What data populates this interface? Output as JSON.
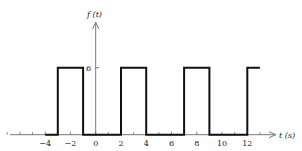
{
  "chart_data": {
    "type": "line",
    "title": "",
    "xlabel": "t (s)",
    "ylabel": "f(t)",
    "xlim": [
      -7.5,
      14.2
    ],
    "ylim": [
      0,
      6
    ],
    "x_ticks": [
      -4,
      -2,
      0,
      2,
      4,
      6,
      8,
      10,
      12
    ],
    "y_ticks": [
      6
    ],
    "grid": false,
    "legend": null,
    "series": [
      {
        "name": "f(t)",
        "style": "step (rectangular pulse train)",
        "x": [
          -4,
          -3,
          -3,
          -1,
          -1,
          2,
          2,
          4,
          4,
          7,
          7,
          9,
          9,
          12,
          12,
          13
        ],
        "y": [
          0,
          0,
          6,
          6,
          0,
          0,
          6,
          6,
          0,
          0,
          6,
          6,
          0,
          0,
          6,
          6
        ]
      }
    ]
  },
  "labels": {
    "y_axis": "f (t)",
    "x_axis": "t (s)",
    "y_tick": "6",
    "x_ticks": [
      "−4",
      "−2",
      "0",
      "2",
      "4",
      "6",
      "8",
      "10",
      "12"
    ]
  },
  "colors": {
    "line": "#111111",
    "axis": "#444444",
    "background": "#ffffff"
  }
}
